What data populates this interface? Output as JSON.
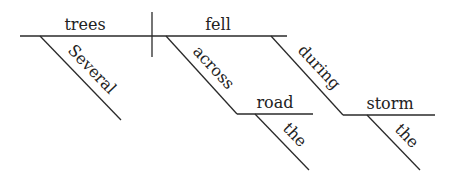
{
  "diagram": {
    "type": "sentence-diagram",
    "sentence": "Several trees fell across the road during the storm",
    "subject": "trees",
    "verb": "fell",
    "modifiers": {
      "subject_modifier": "Several",
      "prep1": "across",
      "prep1_object": "road",
      "prep1_object_modifier": "the",
      "prep2": "during",
      "prep2_object": "storm",
      "prep2_object_modifier": "the"
    }
  }
}
